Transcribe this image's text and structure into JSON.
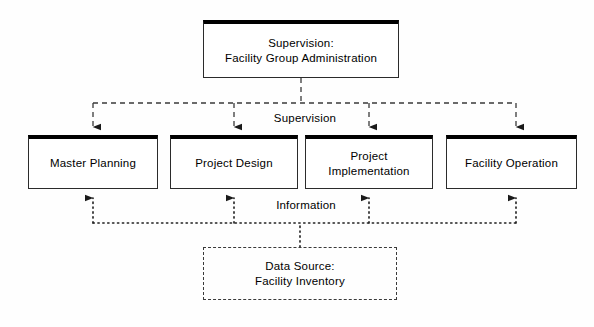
{
  "diagram": {
    "background_color": "#fefefe",
    "line_color": "#3a3a3a",
    "box_border_color": "#2b2b2b",
    "box_header_color": "#000000",
    "nodes": {
      "supervision": {
        "label": "Supervision:\nFacility Group Administration",
        "style": "solid"
      },
      "master_planning": {
        "label": "Master Planning",
        "style": "solid"
      },
      "project_design": {
        "label": "Project Design",
        "style": "solid"
      },
      "project_implementation": {
        "label": "Project\nImplementation",
        "style": "solid"
      },
      "facility_operation": {
        "label": "Facility Operation",
        "style": "solid"
      },
      "data_source": {
        "label": "Data Source:\nFacility Inventory",
        "style": "dashed"
      }
    },
    "edge_labels": {
      "supervision_flow": "Supervision",
      "information_flow": "Information"
    },
    "flows": [
      {
        "name": "supervision",
        "from": "supervision",
        "to": [
          "master_planning",
          "project_design",
          "project_implementation",
          "facility_operation"
        ],
        "line_style": "dashed",
        "direction": "downward",
        "arrowhead": "filled-triangle"
      },
      {
        "name": "information",
        "from": "data_source",
        "to": [
          "master_planning",
          "project_design",
          "project_implementation",
          "facility_operation"
        ],
        "line_style": "dotted",
        "direction": "upward",
        "arrowhead": "filled-triangle"
      }
    ]
  }
}
